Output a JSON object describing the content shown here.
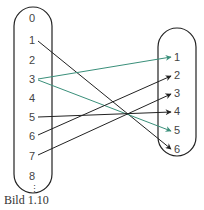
{
  "caption": "Bild 1.10",
  "colors": {
    "black_arrow": "#222222",
    "green_arrow": "#3a8f7a",
    "outline": "#222222",
    "text": "#444444"
  },
  "left_set": {
    "items": [
      "0",
      "1",
      "2",
      "3",
      "4",
      "5",
      "6",
      "7",
      "8"
    ],
    "ellipsis": "⋮"
  },
  "right_set": {
    "items": [
      "1",
      "2",
      "3",
      "4",
      "5",
      "6"
    ]
  },
  "mappings": [
    {
      "from": "1",
      "to": "6",
      "color": "black"
    },
    {
      "from": "3",
      "to": "1",
      "color": "green"
    },
    {
      "from": "3",
      "to": "5",
      "color": "green"
    },
    {
      "from": "5",
      "to": "4",
      "color": "black"
    },
    {
      "from": "6",
      "to": "2",
      "color": "black"
    },
    {
      "from": "7",
      "to": "3",
      "color": "black"
    }
  ]
}
